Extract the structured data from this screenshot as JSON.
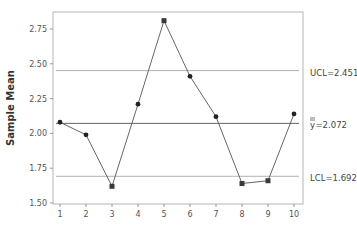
{
  "chart_data": {
    "type": "line",
    "title": "",
    "xlabel": "",
    "ylabel": "Sample Mean",
    "x": [
      1,
      2,
      3,
      4,
      5,
      6,
      7,
      8,
      9,
      10
    ],
    "series": [
      {
        "name": "Sample Mean",
        "values": [
          2.08,
          1.99,
          1.62,
          2.21,
          2.81,
          2.41,
          2.12,
          1.64,
          1.66,
          2.14
        ],
        "out_of_control": [
          false,
          false,
          true,
          false,
          true,
          false,
          false,
          true,
          true,
          false
        ]
      }
    ],
    "control_lines": [
      {
        "name": "UCL",
        "label": "UCL=2.451",
        "value": 2.451
      },
      {
        "name": "center",
        "label": "y̿=2.072",
        "value": 2.072
      },
      {
        "name": "LCL",
        "label": "LCL=1.692",
        "value": 1.692
      }
    ],
    "xticks": [
      "1",
      "2",
      "3",
      "4",
      "5",
      "6",
      "7",
      "8",
      "9",
      "10"
    ],
    "yticks": [
      "1.50",
      "1.75",
      "2.00",
      "2.25",
      "2.50",
      "2.75"
    ],
    "ylim": [
      1.5,
      2.85
    ],
    "xlim": [
      1,
      10
    ],
    "grid": false,
    "legend": "none"
  },
  "labels": {
    "ucl": "UCL=2.451",
    "center_prefix": "y",
    "center_value": "=2.072",
    "lcl": "LCL=1.692",
    "ylabel": "Sample Mean"
  },
  "colors": {
    "line": "#555555",
    "marker": "#222222",
    "control_line": "#b0b0b0",
    "center_line": "#555555",
    "axis": "#999999",
    "text": "#444444"
  }
}
